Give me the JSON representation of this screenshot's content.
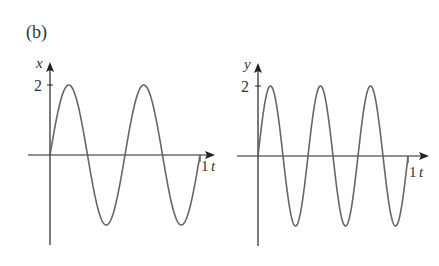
{
  "panel_label": "(b)",
  "chart_data": [
    {
      "type": "line",
      "title": "",
      "xlabel": "t",
      "ylabel": "x",
      "x_tick_labels": [
        "1"
      ],
      "y_tick_labels": [
        "2"
      ],
      "xlim": [
        0,
        1
      ],
      "ylim": [
        -2,
        2
      ],
      "grid": false,
      "function": "x = 2 sin(4πt)",
      "amplitude": 2,
      "periods_in_range": 2,
      "series": [
        {
          "name": "x(t)",
          "x": [
            0,
            0.125,
            0.25,
            0.375,
            0.5,
            0.625,
            0.75,
            0.875,
            1.0
          ],
          "values": [
            0,
            2,
            0,
            -2,
            0,
            2,
            0,
            -2,
            0
          ]
        }
      ]
    },
    {
      "type": "line",
      "title": "",
      "xlabel": "t",
      "ylabel": "y",
      "x_tick_labels": [
        "1"
      ],
      "y_tick_labels": [
        "2"
      ],
      "xlim": [
        0,
        1
      ],
      "ylim": [
        -2,
        2
      ],
      "grid": false,
      "function": "y = 2 sin(6πt)",
      "amplitude": 2,
      "periods_in_range": 3,
      "series": [
        {
          "name": "y(t)",
          "x": [
            0,
            0.0833,
            0.1667,
            0.25,
            0.3333,
            0.4167,
            0.5,
            0.5833,
            0.6667,
            0.75,
            0.8333,
            0.9167,
            1.0
          ],
          "values": [
            0,
            2,
            0,
            -2,
            0,
            2,
            0,
            -2,
            0,
            2,
            0,
            -2,
            0
          ]
        }
      ]
    }
  ],
  "left_plot": {
    "y_axis_label": "x",
    "x_axis_label": "t",
    "y_tick": "2",
    "x_tick": "1"
  },
  "right_plot": {
    "y_axis_label": "y",
    "x_axis_label": "t",
    "y_tick": "2",
    "x_tick": "1"
  },
  "colors": {
    "axis": "#222222",
    "curve": "#666666",
    "text": "#333333"
  }
}
